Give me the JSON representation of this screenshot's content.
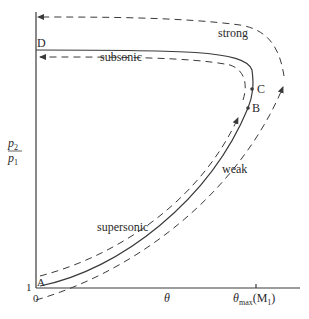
{
  "diagram": {
    "axes": {
      "y_label_num": "p",
      "y_label_num_sub": "2",
      "y_label_den": "p",
      "y_label_den_sub": "1",
      "y_origin_tick": "1",
      "x_origin_tick": "0",
      "x_label": "θ",
      "x_max_label_main": "θ",
      "x_max_label_sub": "max",
      "x_max_label_paren": "(M",
      "x_max_label_paren_sub": "1",
      "x_max_label_close": ")"
    },
    "points": {
      "A": "A",
      "B": "B",
      "C": "C",
      "D": "D"
    },
    "curve_labels": {
      "strong": "strong",
      "subsonic": "subsonic",
      "supersonic": "supersonic",
      "weak": "weak"
    },
    "colors": {
      "ink": "#3a3a3a",
      "background": "#ffffff"
    }
  }
}
